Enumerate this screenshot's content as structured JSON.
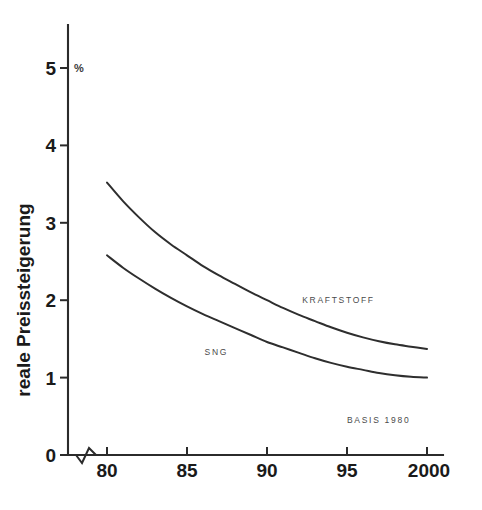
{
  "chart_data": {
    "type": "line",
    "title": "",
    "subtitle": "",
    "xlabel": "",
    "ylabel": "reale Preissteigerung",
    "unit_label": "%",
    "x_tick_labels": [
      "80",
      "85",
      "90",
      "95",
      "2000"
    ],
    "x_tick_values": [
      80,
      85,
      90,
      95,
      100
    ],
    "y_tick_labels": [
      "0",
      "1",
      "2",
      "3",
      "4",
      "5"
    ],
    "y_tick_values": [
      0,
      1,
      2,
      3,
      4,
      5
    ],
    "xlim": [
      80,
      100
    ],
    "ylim": [
      0,
      5.35
    ],
    "grid": false,
    "legend_position": "inline-curve-labels",
    "axis_break": true,
    "annotations": [
      {
        "name": "basis-note",
        "text": "BASIS 1980",
        "x": 95.0,
        "y": 0.42
      }
    ],
    "series": [
      {
        "name": "KRAFTSTOFF",
        "label": "KRAFTSTOFF",
        "label_x": 92.2,
        "label_y": 1.96,
        "x": [
          80,
          81,
          82,
          83,
          84,
          85,
          86,
          87,
          88,
          89,
          90,
          91,
          92,
          93,
          94,
          95,
          96,
          97,
          98,
          99,
          100
        ],
        "values": [
          3.52,
          3.28,
          3.07,
          2.88,
          2.72,
          2.58,
          2.44,
          2.32,
          2.21,
          2.1,
          2.0,
          1.9,
          1.81,
          1.73,
          1.65,
          1.58,
          1.52,
          1.47,
          1.43,
          1.4,
          1.37
        ]
      },
      {
        "name": "SNG",
        "label": "SNG",
        "label_x": 86.1,
        "label_y": 1.29,
        "x": [
          80,
          81,
          82,
          83,
          84,
          85,
          86,
          87,
          88,
          89,
          90,
          91,
          92,
          93,
          94,
          95,
          96,
          97,
          98,
          99,
          100
        ],
        "values": [
          2.58,
          2.42,
          2.28,
          2.15,
          2.03,
          1.92,
          1.82,
          1.73,
          1.64,
          1.55,
          1.46,
          1.39,
          1.32,
          1.25,
          1.19,
          1.14,
          1.1,
          1.06,
          1.03,
          1.01,
          1.0
        ]
      }
    ],
    "colors": {
      "background": "#ffffff",
      "axis": "#2b2b2b",
      "curve": "#2e2e2e",
      "text": "#1a1a1a",
      "label_text": "#4a4a4a"
    }
  }
}
